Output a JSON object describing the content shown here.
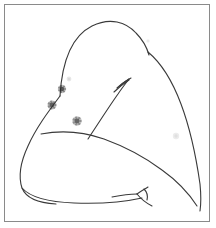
{
  "document": {
    "kind": "scanned-line-drawing",
    "title": "Anatomical line drawing with lesion marks",
    "width": 216,
    "height": 228,
    "background_color": "#ffffff"
  },
  "frame": {
    "name": "image-border",
    "stroke_color": "#8a8a8a",
    "stroke_width": 1,
    "x": 4.5,
    "y": 4.5,
    "width": 205,
    "height": 217
  },
  "drawing": {
    "stroke_color": "#3a3a3a",
    "stroke_width": 1.1,
    "paths": [
      {
        "name": "shoulder-upper-contour",
        "d": "M 60 96 C 62 62 72 36 92 26 C 110 17 126 22 136 33 C 143 40 147 48 149 55"
      },
      {
        "name": "right-flank-contour",
        "d": "M 148 52 C 160 62 172 80 181 104 C 190 128 196 156 200 184 C 201 194 201 204 200 211"
      },
      {
        "name": "left-flank-contour",
        "d": "M 60 96 C 48 112 36 128 28 146 C 21 161 18 176 22 188 C 26 198 38 203 56 204"
      },
      {
        "name": "lower-body-contour",
        "d": "M 22 188 C 30 197 48 202 74 203 C 100 204 124 202 142 198"
      },
      {
        "name": "arm-underside-curve",
        "d": "M 41 134 C 62 130 84 132 104 139 C 126 147 146 158 162 170 C 176 180 188 192 197 206"
      },
      {
        "name": "rib-diagonal-line",
        "d": "M 88 139 C 98 124 108 108 118 94 C 122 88 126 83 129 79"
      },
      {
        "name": "rib-branch-upper",
        "d": "M 129 79 C 124 82 120 85 117 88"
      },
      {
        "name": "rib-branch-lower",
        "d": "M 129 80 C 123 84 118 88 114 92"
      },
      {
        "name": "rib-branch-tip",
        "d": "M 131 78 C 127 80 123 83 120 86"
      },
      {
        "name": "navel-branch-left",
        "d": "M 112 197 C 122 195 130 194 137 194"
      },
      {
        "name": "navel-branch-stem",
        "d": "M 137 194 C 141 191 145 189 148 187"
      },
      {
        "name": "navel-branch-down",
        "d": "M 137 194 C 141 199 146 203 152 206"
      },
      {
        "name": "navel-branch-hook",
        "d": "M 144 189 C 147 192 148 196 147 200"
      }
    ]
  },
  "marks": {
    "label": "lesion marks",
    "color": "#2e2e2e",
    "lesions": [
      {
        "name": "lesion-mark-1",
        "cx": 62,
        "cy": 89,
        "r": 4.2,
        "opacity": 0.85
      },
      {
        "name": "lesion-mark-2",
        "cx": 52,
        "cy": 105,
        "r": 4.6,
        "opacity": 0.82
      },
      {
        "name": "lesion-mark-3",
        "cx": 77,
        "cy": 121,
        "r": 4.8,
        "opacity": 0.78
      }
    ],
    "faint_marks": [
      {
        "name": "faint-mark-upper",
        "cx": 69,
        "cy": 79,
        "r": 2.4,
        "opacity": 0.22
      },
      {
        "name": "faint-mark-right",
        "cx": 176,
        "cy": 136,
        "r": 3.2,
        "opacity": 0.18
      },
      {
        "name": "faint-mark-shoulder",
        "cx": 148,
        "cy": 41,
        "r": 1.8,
        "opacity": 0.14
      }
    ]
  },
  "annotations": {
    "alt_text": "Hand-drawn outline of a torso seen from the side with three dark circular lesion marks on the upper left region"
  }
}
